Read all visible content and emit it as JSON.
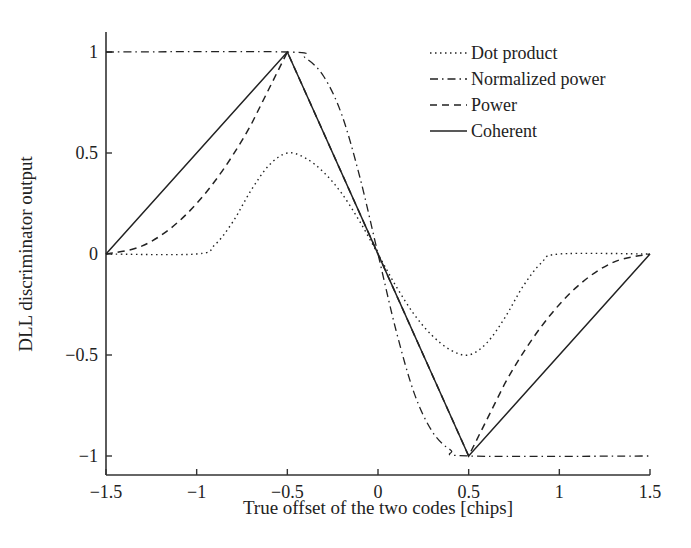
{
  "chart_data": {
    "type": "line",
    "title": "",
    "xlabel": "True offset of the two codes [chips]",
    "ylabel": "DLL discriminator output",
    "xlim": [
      -1.5,
      1.5
    ],
    "ylim": [
      -1.1,
      1.1
    ],
    "xticks": [
      -1.5,
      -1,
      -0.5,
      0,
      0.5,
      1,
      1.5
    ],
    "xtick_labels": [
      "−1.5",
      "−1",
      "−0.5",
      "0",
      "0.5",
      "1",
      "1.5"
    ],
    "yticks": [
      -1,
      -0.5,
      0,
      0.5,
      1
    ],
    "ytick_labels": [
      "−1",
      "−0.5",
      "0",
      "0.5",
      "1"
    ],
    "grid": false,
    "legend_position": "upper right",
    "series": [
      {
        "name": "Dot product",
        "style": "dotted",
        "x": [
          -1.5,
          -1.0,
          -0.9,
          -0.8,
          -0.7,
          -0.6,
          -0.5,
          -0.4,
          -0.3,
          -0.2,
          -0.1,
          0,
          0.1,
          0.2,
          0.3,
          0.4,
          0.5,
          0.6,
          0.7,
          0.8,
          0.9,
          1.0,
          1.5
        ],
        "y": [
          0,
          0,
          0.045,
          0.16,
          0.315,
          0.44,
          0.5,
          0.475,
          0.405,
          0.3,
          0.16,
          0,
          -0.16,
          -0.3,
          -0.405,
          -0.475,
          -0.5,
          -0.44,
          -0.315,
          -0.16,
          -0.045,
          0,
          0
        ]
      },
      {
        "name": "Normalized power",
        "style": "dashdot",
        "x": [
          -1.5,
          -0.5,
          -0.4,
          -0.3,
          -0.2,
          -0.1,
          0,
          0.1,
          0.2,
          0.3,
          0.4,
          0.5,
          1.5
        ],
        "y": [
          1,
          1,
          0.97,
          0.88,
          0.69,
          0.38,
          0,
          -0.38,
          -0.69,
          -0.88,
          -0.97,
          -1,
          -1
        ]
      },
      {
        "name": "Power",
        "style": "dashed",
        "x": [
          -1.5,
          -1.3,
          -1.1,
          -0.9,
          -0.7,
          -0.5,
          0,
          0.5,
          0.7,
          0.9,
          1.1,
          1.3,
          1.5
        ],
        "y": [
          0,
          0.04,
          0.16,
          0.36,
          0.64,
          1,
          0,
          -1,
          -0.64,
          -0.36,
          -0.16,
          -0.04,
          0
        ]
      },
      {
        "name": "Coherent",
        "style": "solid",
        "x": [
          -1.5,
          -0.5,
          0.5,
          1.5
        ],
        "y": [
          0,
          1,
          -1,
          0
        ]
      }
    ]
  },
  "legend": {
    "items": [
      {
        "label": "Dot product"
      },
      {
        "label": "Normalized power"
      },
      {
        "label": "Power"
      },
      {
        "label": "Coherent"
      }
    ]
  },
  "axes": {
    "xlabel": "True offset of the two codes [chips]",
    "ylabel": "DLL discriminator output"
  }
}
